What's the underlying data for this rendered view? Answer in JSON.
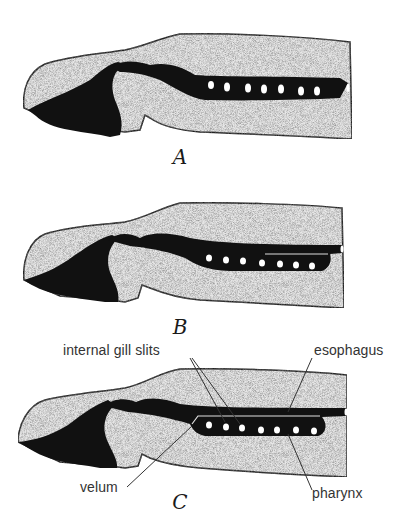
{
  "figures": [
    {
      "id": "A",
      "label": "A",
      "gill_slits": 7
    },
    {
      "id": "B",
      "label": "B",
      "gill_slits": 7
    },
    {
      "id": "C",
      "label": "C",
      "gill_slits": 7
    }
  ],
  "callouts": {
    "internal_gill_slits": "internal gill slits",
    "esophagus": "esophagus",
    "velum": "velum",
    "pharynx": "pharynx"
  },
  "colors": {
    "tissue_fill": "#e8e8e8",
    "dark_fill": "#111111",
    "outline": "#222222",
    "background": "#ffffff"
  }
}
